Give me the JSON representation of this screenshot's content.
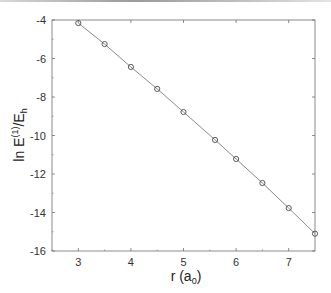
{
  "chart_data": {
    "type": "line",
    "title": "",
    "xlabel": "r (a0)",
    "xlabel_parts": {
      "main": "r (a",
      "sub": "0",
      "end": ")"
    },
    "ylabel": "ln E^(1)/E_h",
    "ylabel_parts": {
      "main": "ln E",
      "sup": "(1)",
      "mid": "/E",
      "sub": "h"
    },
    "xlim": [
      2.5,
      7.5
    ],
    "ylim": [
      -16,
      -4
    ],
    "x_ticks": [
      3,
      4,
      5,
      6,
      7
    ],
    "x_tick_labels": [
      "3",
      "4",
      "5",
      "6",
      "7"
    ],
    "x_minor_ticks": [
      2.5,
      3.5,
      4.5,
      5.5,
      6.5
    ],
    "y_ticks": [
      -4,
      -6,
      -8,
      -10,
      -12,
      -14,
      -16
    ],
    "y_tick_labels": [
      "-4",
      "-6",
      "-8",
      "-10",
      "-12",
      "-14",
      "-16"
    ],
    "y_minor_ticks": [
      -5,
      -7,
      -9,
      -11,
      -13,
      -15
    ],
    "grid": false,
    "legend": null,
    "series": [
      {
        "name": "ln E(1)/Eh",
        "marker": "circle-open",
        "line": "solid",
        "color": "#555555",
        "x": [
          3.0,
          3.5,
          4.0,
          4.5,
          5.0,
          5.6,
          6.0,
          6.5,
          7.0,
          7.5
        ],
        "y": [
          -4.16,
          -5.25,
          -6.44,
          -7.58,
          -8.78,
          -10.23,
          -11.22,
          -12.47,
          -13.77,
          -15.1
        ]
      }
    ]
  },
  "colors": {
    "axis": "#6e6e6e",
    "line": "#7a7a7a",
    "marker": "#4a4a4a"
  }
}
